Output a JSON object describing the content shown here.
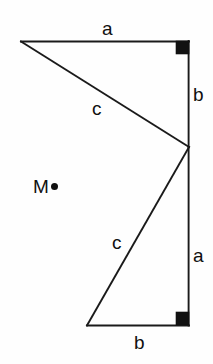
{
  "figure": {
    "background_color": "#fefefe",
    "stroke_color": "#1a1a1a",
    "label_color": "#101010",
    "labels": {
      "top_side_a": "a",
      "upper_hypotenuse_c": "c",
      "upper_vertical_b": "b",
      "centre_point": "M",
      "lower_vertical_a": "a",
      "lower_hypotenuse_c": "c",
      "bottom_side_b": "b"
    },
    "vertices": {
      "top_left": [
        21,
        41
      ],
      "top_right": [
        189,
        41
      ],
      "middle_right": [
        189,
        147
      ],
      "bottom_left": [
        87,
        325
      ],
      "bottom_right": [
        189,
        325
      ]
    },
    "right_angle_markers": [
      {
        "name": "top-right-angle",
        "x": 176,
        "y": 41,
        "size": 13
      },
      {
        "name": "bottom-right-angle",
        "x": 176,
        "y": 311,
        "size": 13
      }
    ],
    "centre_marker": {
      "name": "M",
      "x": 33,
      "y": 178
    }
  }
}
